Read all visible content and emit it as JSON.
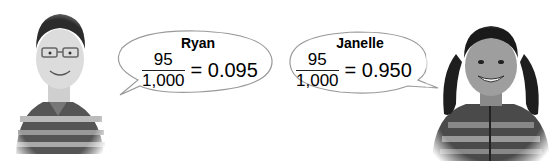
{
  "students": [
    {
      "name": "Ryan",
      "numerator": "95",
      "denominator": "1,000",
      "result": "= 0.095",
      "photo": "boy-with-glasses-striped-polo"
    },
    {
      "name": "Janelle",
      "numerator": "95",
      "denominator": "1,000",
      "result": "= 0.950",
      "photo": "girl-with-pigtails-striped-hoodie"
    }
  ],
  "colors": {
    "bubble_stroke": "#9a9a9a",
    "text": "#1a1a1a"
  }
}
